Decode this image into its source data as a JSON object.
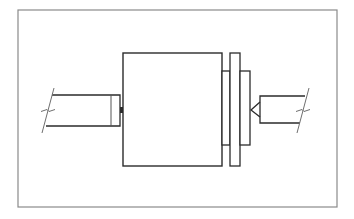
{
  "diagram": {
    "type": "mechanical-assembly-drawing",
    "colors": {
      "background": "#ffffff",
      "frame": "#8a8a8a",
      "line": "#2b2b2b",
      "break_line": "#6f6f6f"
    },
    "frame": {
      "x": 18,
      "y": 10,
      "w": 319,
      "h": 197
    },
    "parts": {
      "main_block": {
        "x": 123,
        "y": 53,
        "w": 99,
        "h": 113
      },
      "left_collar": {
        "x": 222,
        "y": 71,
        "w": 8,
        "h": 74
      },
      "flange_plate": {
        "x": 230,
        "y": 53,
        "w": 10,
        "h": 113
      },
      "right_collar": {
        "x": 240,
        "y": 71,
        "w": 10,
        "h": 74
      },
      "left_shaft": {
        "x_start": 52,
        "x_end": 120,
        "y_top": 95,
        "y_bottom": 126,
        "inner_line_x": 111
      },
      "left_nub": {
        "x": 120,
        "y": 107,
        "w": 3,
        "h": 6
      },
      "right_shaft": {
        "x_start": 260,
        "x_end": 305,
        "y_top": 96,
        "y_bottom": 123
      },
      "right_center_cone": {
        "tip_x": 251,
        "tip_y": 110
      }
    },
    "break_lines": [
      {
        "name": "left",
        "x1": 54,
        "y1": 88,
        "x2": 42,
        "y2": 133
      },
      {
        "name": "right",
        "x1": 309,
        "y1": 88,
        "x2": 297,
        "y2": 133
      }
    ]
  }
}
